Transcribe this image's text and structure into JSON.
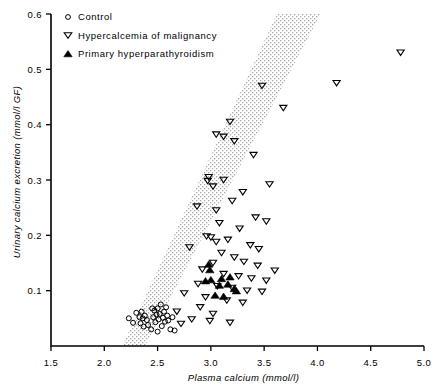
{
  "chart_data": {
    "type": "scatter",
    "title": "",
    "xlabel": "Plasma calcium (mmol/l)",
    "ylabel": "Urinary calcium excretion (mmol/l GF)",
    "xlim": [
      1.5,
      5.0
    ],
    "ylim": [
      0.0,
      0.6
    ],
    "xticks": [
      "1.5",
      "2.0",
      "2.5",
      "3.0",
      "3.5",
      "4.0",
      "4.5",
      "5.0"
    ],
    "xtick_values": [
      1.5,
      2.0,
      2.5,
      3.0,
      3.5,
      4.0,
      4.5,
      5.0
    ],
    "yticks": [
      "0.1",
      "0.2",
      "0.3",
      "0.4",
      "0.5",
      "0.6"
    ],
    "ytick_values": [
      0.1,
      0.2,
      0.3,
      0.4,
      0.5,
      0.6
    ],
    "grid": false,
    "legend_position": "top-left",
    "marker_colors": {
      "control": "#000000",
      "hypercalcemia": "#000000",
      "primary": "#000000",
      "band_fill": "#b9b9b9",
      "axis": "#000000"
    },
    "band": {
      "name": "normal reference range band",
      "style": "stippled",
      "lower_edge": [
        [
          2.17,
          0.0
        ],
        [
          3.62,
          0.6
        ]
      ],
      "upper_edge": [
        [
          2.38,
          0.0
        ],
        [
          4.03,
          0.6
        ]
      ]
    },
    "series": [
      {
        "name": "Control",
        "marker": "open-circle",
        "points": [
          [
            2.23,
            0.05
          ],
          [
            2.27,
            0.042
          ],
          [
            2.3,
            0.06
          ],
          [
            2.33,
            0.052
          ],
          [
            2.34,
            0.041
          ],
          [
            2.35,
            0.062
          ],
          [
            2.36,
            0.05
          ],
          [
            2.37,
            0.035
          ],
          [
            2.38,
            0.055
          ],
          [
            2.4,
            0.047
          ],
          [
            2.41,
            0.038
          ],
          [
            2.44,
            0.03
          ],
          [
            2.46,
            0.052
          ],
          [
            2.47,
            0.064
          ],
          [
            2.48,
            0.043
          ],
          [
            2.49,
            0.057
          ],
          [
            2.5,
            0.068
          ],
          [
            2.51,
            0.048
          ],
          [
            2.52,
            0.058
          ],
          [
            2.53,
            0.075
          ],
          [
            2.54,
            0.036
          ],
          [
            2.55,
            0.051
          ],
          [
            2.56,
            0.062
          ],
          [
            2.57,
            0.044
          ],
          [
            2.58,
            0.07
          ],
          [
            2.59,
            0.055
          ],
          [
            2.6,
            0.046
          ],
          [
            2.62,
            0.03
          ],
          [
            2.64,
            0.052
          ],
          [
            2.66,
            0.028
          ],
          [
            2.5,
            0.026
          ],
          [
            2.45,
            0.068
          ]
        ]
      },
      {
        "name": "Hypercalcemia of malignancy",
        "marker": "open-down-triangle",
        "points": [
          [
            4.78,
            0.53
          ],
          [
            4.18,
            0.475
          ],
          [
            3.68,
            0.43
          ],
          [
            3.48,
            0.47
          ],
          [
            3.18,
            0.405
          ],
          [
            3.05,
            0.382
          ],
          [
            3.12,
            0.378
          ],
          [
            3.22,
            0.37
          ],
          [
            3.4,
            0.345
          ],
          [
            3.55,
            0.292
          ],
          [
            3.12,
            0.3
          ],
          [
            2.98,
            0.305
          ],
          [
            2.97,
            0.298
          ],
          [
            3.02,
            0.288
          ],
          [
            3.3,
            0.278
          ],
          [
            2.87,
            0.252
          ],
          [
            3.2,
            0.262
          ],
          [
            3.42,
            0.232
          ],
          [
            3.52,
            0.225
          ],
          [
            3.08,
            0.222
          ],
          [
            3.27,
            0.212
          ],
          [
            2.96,
            0.198
          ],
          [
            3.0,
            0.196
          ],
          [
            3.05,
            0.188
          ],
          [
            3.16,
            0.192
          ],
          [
            3.37,
            0.182
          ],
          [
            3.45,
            0.175
          ],
          [
            2.8,
            0.178
          ],
          [
            3.1,
            0.168
          ],
          [
            3.22,
            0.16
          ],
          [
            3.02,
            0.15
          ],
          [
            3.31,
            0.152
          ],
          [
            3.44,
            0.145
          ],
          [
            2.92,
            0.138
          ],
          [
            3.12,
            0.13
          ],
          [
            3.26,
            0.126
          ],
          [
            3.38,
            0.122
          ],
          [
            3.52,
            0.118
          ],
          [
            2.88,
            0.112
          ],
          [
            3.06,
            0.108
          ],
          [
            3.2,
            0.105
          ],
          [
            3.34,
            0.1
          ],
          [
            3.48,
            0.098
          ],
          [
            2.75,
            0.095
          ],
          [
            2.95,
            0.088
          ],
          [
            3.15,
            0.082
          ],
          [
            3.3,
            0.078
          ],
          [
            2.68,
            0.062
          ],
          [
            2.82,
            0.048
          ],
          [
            2.99,
            0.045
          ],
          [
            3.18,
            0.042
          ],
          [
            2.72,
            0.04
          ],
          [
            3.02,
            0.058
          ],
          [
            2.9,
            0.07
          ],
          [
            3.6,
            0.136
          ],
          [
            3.05,
            0.245
          ]
        ]
      },
      {
        "name": "Primary hyperparathyroidism",
        "marker": "filled-up-triangle",
        "points": [
          [
            2.99,
            0.138
          ],
          [
            3.0,
            0.12
          ],
          [
            2.95,
            0.118
          ],
          [
            3.1,
            0.122
          ],
          [
            3.08,
            0.11
          ],
          [
            3.18,
            0.125
          ],
          [
            3.16,
            0.112
          ],
          [
            3.22,
            0.104
          ],
          [
            3.24,
            0.1
          ],
          [
            3.04,
            0.092
          ],
          [
            3.12,
            0.09
          ],
          [
            2.98,
            0.148
          ]
        ]
      }
    ]
  },
  "legend": {
    "items": [
      {
        "marker": "open-circle",
        "label": "Control"
      },
      {
        "marker": "open-down-triangle",
        "label": "Hypercalcemia of malignancy"
      },
      {
        "marker": "filled-up-triangle",
        "label": "Primary hyperparathyroidism"
      }
    ]
  }
}
